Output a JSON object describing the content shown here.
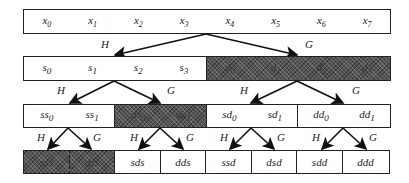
{
  "diagram": {
    "filters": {
      "lowpass": "H",
      "highpass": "G"
    },
    "level0": {
      "cells": [
        {
          "items": [
            "x0",
            "x1",
            "x2",
            "x3",
            "x4",
            "x5",
            "x6",
            "x7"
          ],
          "shaded": false
        }
      ]
    },
    "level1": {
      "cells": [
        {
          "items": [
            "s0",
            "s1",
            "s2",
            "s3"
          ],
          "shaded": false
        },
        {
          "items": [
            "d0",
            "d1",
            "d2",
            "d3"
          ],
          "shaded": true
        }
      ]
    },
    "level2": {
      "cells": [
        {
          "items": [
            "ss0",
            "ss1"
          ],
          "shaded": false
        },
        {
          "items": [
            "ds0",
            "ds1"
          ],
          "shaded": true
        },
        {
          "items": [
            "sd0",
            "sd1"
          ],
          "shaded": false
        },
        {
          "items": [
            "dd0",
            "dd1"
          ],
          "shaded": false
        }
      ]
    },
    "level3": {
      "cells": [
        {
          "items": [
            "sss"
          ],
          "shaded": true
        },
        {
          "items": [
            "dss"
          ],
          "shaded": true
        },
        {
          "items": [
            "sds"
          ],
          "shaded": false
        },
        {
          "items": [
            "dds"
          ],
          "shaded": false
        },
        {
          "items": [
            "ssd"
          ],
          "shaded": false
        },
        {
          "items": [
            "dsd"
          ],
          "shaded": false
        },
        {
          "items": [
            "sdd"
          ],
          "shaded": false
        },
        {
          "items": [
            "ddd"
          ],
          "shaded": false
        }
      ]
    },
    "colors": {
      "border": "#222222",
      "shade": "#555555",
      "background": "#ffffff"
    }
  }
}
